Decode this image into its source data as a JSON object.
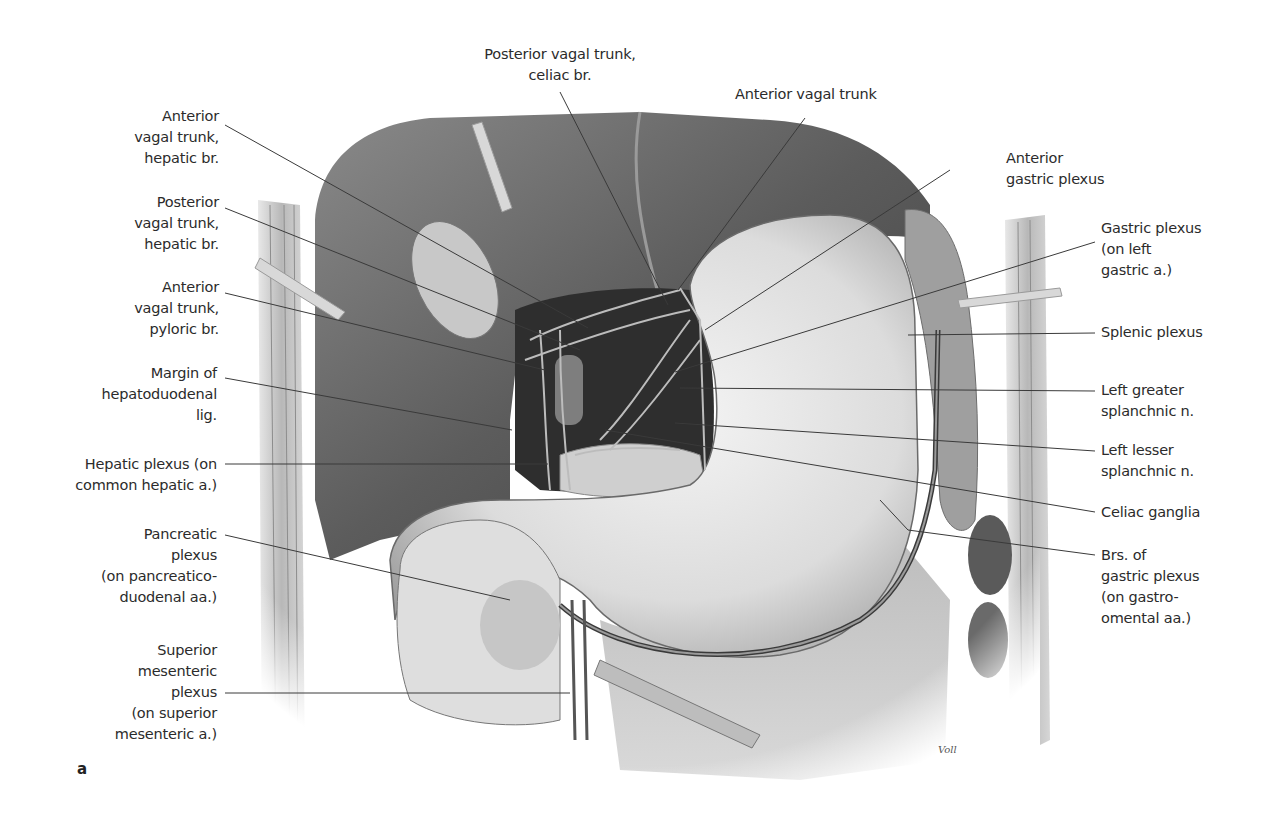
{
  "figure": {
    "panel_letter": "a",
    "signature": "Voll",
    "colors": {
      "leader_line": "#3a3a3a",
      "text": "#2b2b2b",
      "background": "#ffffff"
    }
  },
  "labels": {
    "left": [
      {
        "id": "anterior-vagal-hepatic",
        "text": "Anterior\nvagal trunk,\nhepatic br."
      },
      {
        "id": "posterior-vagal-hepatic",
        "text": "Posterior\nvagal trunk,\nhepatic br."
      },
      {
        "id": "anterior-vagal-pyloric",
        "text": "Anterior\nvagal trunk,\npyloric br."
      },
      {
        "id": "hepatoduodenal-margin",
        "text": "Margin of\nhepatoduodenal\nlig."
      },
      {
        "id": "hepatic-plexus",
        "text": "Hepatic plexus (on\ncommon hepatic a.)"
      },
      {
        "id": "pancreatic-plexus",
        "text": "Pancreatic\nplexus\n(on pancreatico-\nduodenal aa.)"
      },
      {
        "id": "superior-mesenteric-plexus",
        "text": "Superior\nmesenteric\nplexus\n(on superior\nmesenteric a.)"
      }
    ],
    "top": [
      {
        "id": "posterior-vagal-celiac",
        "text": "Posterior vagal trunk,\nceliac br."
      },
      {
        "id": "anterior-vagal-trunk",
        "text": "Anterior vagal trunk"
      }
    ],
    "right": [
      {
        "id": "anterior-gastric-plexus",
        "text": "Anterior\ngastric plexus"
      },
      {
        "id": "gastric-plexus-left-gastric",
        "text": "Gastric plexus\n(on left\ngastric a.)"
      },
      {
        "id": "splenic-plexus",
        "text": "Splenic plexus"
      },
      {
        "id": "left-greater-splanchnic",
        "text": "Left greater\nsplanchnic n."
      },
      {
        "id": "left-lesser-splanchnic",
        "text": "Left lesser\nsplanchnic n."
      },
      {
        "id": "celiac-ganglia",
        "text": "Celiac ganglia"
      },
      {
        "id": "gastric-plexus-gastroomental",
        "text": "Brs. of\ngastric plexus\n(on gastro-\nomental aa.)"
      }
    ]
  }
}
